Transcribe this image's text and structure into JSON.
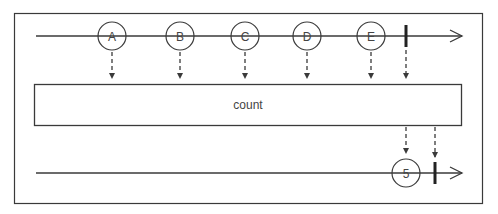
{
  "diagram": {
    "colors": {
      "line": "#3a3a3a",
      "text": "#444444",
      "background": "#ffffff"
    },
    "operator": {
      "label": "count"
    },
    "input_stream": {
      "events": [
        {
          "label": "A",
          "x": 112
        },
        {
          "label": "B",
          "x": 180
        },
        {
          "label": "C",
          "x": 245
        },
        {
          "label": "D",
          "x": 307
        },
        {
          "label": "E",
          "x": 371
        }
      ],
      "completion_x": 406
    },
    "output_stream": {
      "events": [
        {
          "label": "5",
          "x": 406
        }
      ],
      "completion_x": 435
    }
  }
}
